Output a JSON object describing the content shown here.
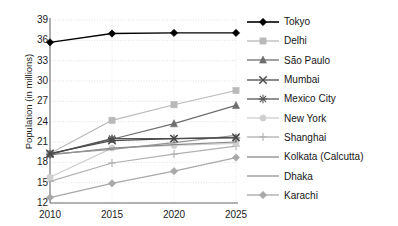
{
  "chart_data": {
    "type": "line",
    "title": "",
    "xlabel": "",
    "ylabel": "Population (in millions)",
    "categories": [
      "2010",
      "2015",
      "2020",
      "2025"
    ],
    "x": [
      2010,
      2015,
      2020,
      2025
    ],
    "ylim": [
      12,
      39
    ],
    "yticks": [
      12,
      15,
      18,
      21,
      24,
      27,
      30,
      33,
      36,
      39
    ],
    "grid": true,
    "legend_position": "right",
    "series": [
      {
        "name": "Tokyo",
        "values": [
          35.7,
          37.0,
          37.1,
          37.1
        ],
        "color": "#000000",
        "marker": "diamond"
      },
      {
        "name": "Delhi",
        "values": [
          19.3,
          24.2,
          26.5,
          28.6
        ],
        "color": "#b9b9b9",
        "marker": "square"
      },
      {
        "name": "São Paulo",
        "values": [
          19.2,
          21.4,
          23.7,
          26.4
        ],
        "color": "#6e6e6e",
        "marker": "triangle"
      },
      {
        "name": "Mumbai",
        "values": [
          19.3,
          21.2,
          21.5,
          21.7
        ],
        "color": "#4a4a4a",
        "marker": "x"
      },
      {
        "name": "Mexico City",
        "values": [
          19.2,
          21.5,
          21.5,
          21.6
        ],
        "color": "#555555",
        "marker": "star"
      },
      {
        "name": "New York",
        "values": [
          15.8,
          20.1,
          20.5,
          20.8
        ],
        "color": "#cfcfcf",
        "marker": "circle"
      },
      {
        "name": "Shanghai",
        "values": [
          15.2,
          17.9,
          19.2,
          20.4
        ],
        "color": "#b0b0b0",
        "marker": "plus"
      },
      {
        "name": "Kolkata (Calcutta)",
        "values": [
          19.1,
          20.1,
          20.6,
          21.0
        ],
        "color": "#8a8a8a",
        "marker": "none"
      },
      {
        "name": "Dhaka",
        "values": [
          19.2,
          19.9,
          20.9,
          22.0
        ],
        "color": "#949494",
        "marker": "none"
      },
      {
        "name": "Karachi",
        "values": [
          12.8,
          14.9,
          16.7,
          18.7
        ],
        "color": "#a8a8a8",
        "marker": "diamond"
      }
    ]
  },
  "axes": {
    "y_title": "Population (in millions)",
    "y_tick_labels": [
      "39",
      "36",
      "33",
      "30",
      "27",
      "24",
      "21",
      "18",
      "15",
      "12"
    ],
    "x_tick_labels": [
      "2010",
      "2015",
      "2020",
      "2025"
    ]
  },
  "legend": {
    "items": [
      {
        "label": "Tokyo"
      },
      {
        "label": "Delhi"
      },
      {
        "label": "São Paulo"
      },
      {
        "label": "Mumbai"
      },
      {
        "label": "Mexico City"
      },
      {
        "label": "New York"
      },
      {
        "label": "Shanghai"
      },
      {
        "label": "Kolkata (Calcutta)"
      },
      {
        "label": "Dhaka"
      },
      {
        "label": "Karachi"
      }
    ]
  },
  "colors": {
    "axis": "#6b6b6b",
    "grid": "#d9d9d9",
    "text": "#1b1b1b",
    "background": "#ffffff"
  }
}
